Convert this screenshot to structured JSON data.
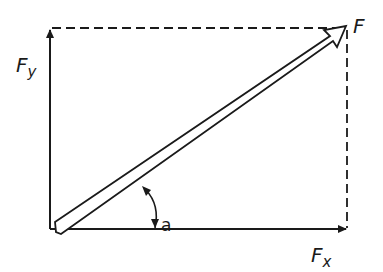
{
  "diagram": {
    "labels": {
      "resultant": "F",
      "x_component_main": "F",
      "x_component_sub": "x",
      "y_component_main": "F",
      "y_component_sub": "y",
      "angle": "a"
    },
    "colors": {
      "stroke": "#1a1a1a",
      "background": "#ffffff"
    }
  }
}
